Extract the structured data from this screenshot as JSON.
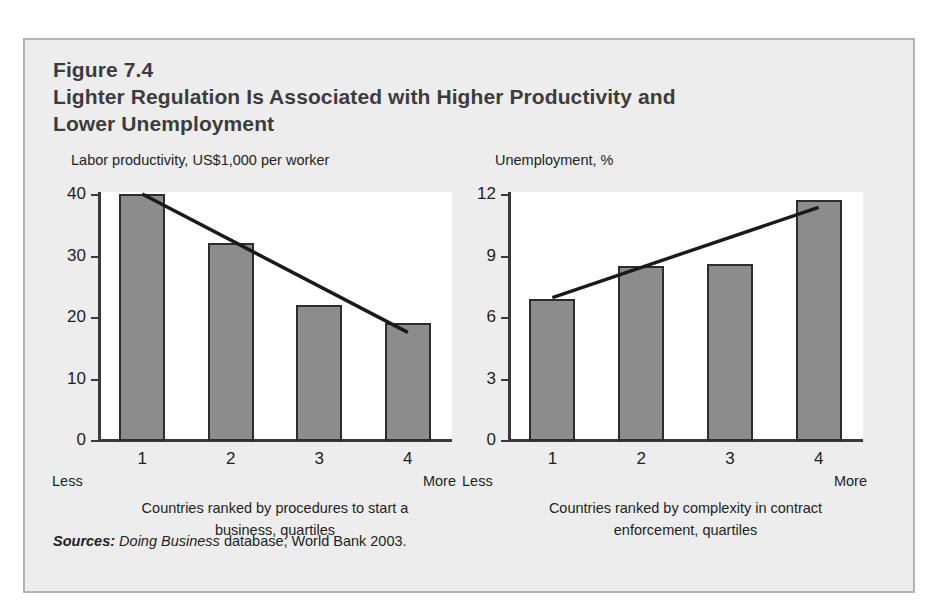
{
  "figure": {
    "number": "Figure 7.4",
    "title": "Lighter Regulation Is Associated with Higher Productivity and Lower Unemployment",
    "source_prefix": "Sources:",
    "source_italic": "Doing Business",
    "source_rest": "database; World Bank 2003."
  },
  "chart_data": [
    {
      "type": "bar",
      "title": "Labor productivity, US$1,000 per worker",
      "xlabel": "Countries ranked by procedures to start a business, quartiles",
      "ylabel": "",
      "categories": [
        "1",
        "2",
        "3",
        "4"
      ],
      "values": [
        40,
        32,
        22,
        19
      ],
      "ylim": [
        0,
        40
      ],
      "yticks": [
        0,
        10,
        20,
        30,
        40
      ],
      "ytick_labels": [
        "0",
        "10",
        "20",
        "30",
        "40"
      ],
      "grid": false,
      "legend": "none",
      "axis_end_labels": {
        "left": "Less",
        "right": "More"
      },
      "trend": {
        "type": "line",
        "x": [
          1,
          4
        ],
        "y": [
          40,
          17.5
        ]
      }
    },
    {
      "type": "bar",
      "title": "Unemployment, %",
      "xlabel": "Countries ranked by complexity in contract enforcement, quartiles",
      "ylabel": "",
      "categories": [
        "1",
        "2",
        "3",
        "4"
      ],
      "values": [
        6.9,
        8.5,
        8.6,
        11.7
      ],
      "ylim": [
        0,
        12
      ],
      "yticks": [
        0,
        3,
        6,
        9,
        12
      ],
      "ytick_labels": [
        "0",
        "3",
        "6",
        "9",
        "12"
      ],
      "grid": false,
      "legend": "none",
      "axis_end_labels": {
        "left": "Less",
        "right": "More"
      },
      "trend": {
        "type": "line",
        "x": [
          1,
          4
        ],
        "y": [
          6.95,
          11.35
        ]
      }
    }
  ],
  "colors": {
    "bar_fill": "#8c8c8c",
    "bar_stroke": "#2d2d2f",
    "axis": "#3a3a3c",
    "trend": "#1a1a1a",
    "panel_bg": "#ededee",
    "plot_bg": "#ffffff",
    "text": "#231f20",
    "heading": "#3c3c3e"
  }
}
